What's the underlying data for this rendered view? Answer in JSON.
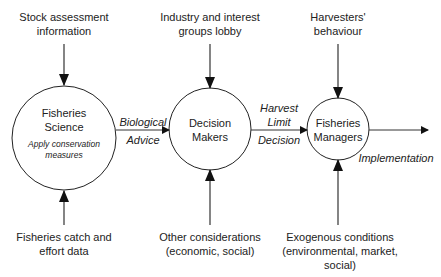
{
  "nodes": {
    "science": {
      "title_line1": "Fisheries",
      "title_line2": "Science",
      "sub_line1": "Apply conservation",
      "sub_line2": "measures"
    },
    "decision": {
      "line1": "Decision",
      "line2": "Makers"
    },
    "managers": {
      "line1": "Fisheries",
      "line2": "Managers"
    }
  },
  "inputs": {
    "stock": {
      "line1": "Stock assessment",
      "line2": "information"
    },
    "catch": {
      "line1": "Fisheries catch and",
      "line2": "effort data"
    },
    "industry": {
      "line1": "Industry and interest",
      "line2": "groups lobby"
    },
    "other": {
      "line1": "Other considerations",
      "line2": "(economic, social)"
    },
    "harvesters": {
      "line1": "Harvesters'",
      "line2": "behaviour"
    },
    "exogenous": {
      "line1": "Exogenous conditions",
      "line2": "(environmental, market,",
      "line3": "social)"
    }
  },
  "edges": {
    "bio_advice": {
      "line1": "Biological",
      "line2": "Advice"
    },
    "harvest": {
      "line1": "Harvest",
      "line2": "Limit",
      "line3": "Decision"
    },
    "implementation": "Implementation"
  }
}
